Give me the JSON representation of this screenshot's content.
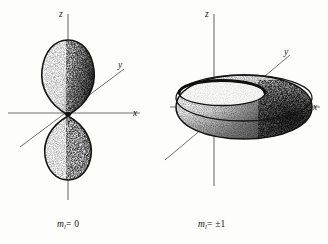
{
  "figure": {
    "background_color": "#fdfdfc",
    "ink_color": "#151515",
    "axis_color": "#6b6b6b",
    "panels": [
      {
        "id": "left",
        "caption_prefix": "m",
        "caption_subscript": "l",
        "caption_relation": "= 0",
        "caption_plain": "m_l = 0",
        "shape": "two-lobe-dumbbell",
        "axes": [
          {
            "name": "z",
            "label": "z",
            "direction": "vertical"
          },
          {
            "name": "x",
            "label": "x",
            "direction": "horizontal"
          },
          {
            "name": "y",
            "label": "y",
            "direction": "diagonal"
          }
        ]
      },
      {
        "id": "right",
        "caption_prefix": "m",
        "caption_subscript": "l",
        "caption_relation": "= ±1",
        "caption_plain": "m_l = ±1",
        "shape": "torus",
        "axes": [
          {
            "name": "z",
            "label": "z",
            "direction": "vertical"
          },
          {
            "name": "x",
            "label": "x",
            "direction": "horizontal"
          },
          {
            "name": "y",
            "label": "y",
            "direction": "diagonal"
          }
        ]
      }
    ]
  }
}
